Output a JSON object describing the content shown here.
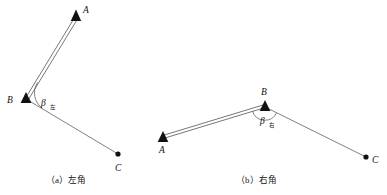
{
  "figure": {
    "background_color": "#ffffff",
    "line_color": "#4a4a4a",
    "marker_color": "#111111",
    "panels": [
      {
        "id": "panel-a",
        "caption_prefix": "（a）",
        "caption_text": "左角",
        "caption_full": "（a）左角",
        "points": [
          {
            "name": "A",
            "label": "A",
            "marker": "triangle",
            "x": 76,
            "y": 15,
            "label_x": 82,
            "label_y": 11
          },
          {
            "name": "B",
            "label": "B",
            "marker": "triangle",
            "x": 26,
            "y": 98,
            "label_x": 9,
            "label_y": 102
          },
          {
            "name": "C",
            "label": "C",
            "marker": "dot",
            "x": 118,
            "y": 154,
            "label_x": 115,
            "label_y": 170
          }
        ],
        "segments": [
          {
            "from": "B",
            "to": "A",
            "style": "double"
          },
          {
            "from": "B",
            "to": "C",
            "style": "single"
          }
        ],
        "angle": {
          "vertex": "B",
          "symbol": "β",
          "subscript": "左",
          "label_x": 41,
          "label_y": 105,
          "arc_radius": 19,
          "sweep": "interior-clockwise-from-A-to-C"
        }
      },
      {
        "id": "panel-b",
        "caption_prefix": "（b）",
        "caption_text": "右角",
        "caption_full": "（b）右角",
        "points": [
          {
            "name": "A",
            "label": "A",
            "marker": "triangle",
            "x": 163,
            "y": 137,
            "label_x": 159,
            "label_y": 152
          },
          {
            "name": "B",
            "label": "B",
            "marker": "triangle",
            "x": 265,
            "y": 106,
            "label_x": 261,
            "label_y": 93
          },
          {
            "name": "C",
            "label": "C",
            "marker": "dot",
            "x": 366,
            "y": 157,
            "label_x": 372,
            "label_y": 170
          }
        ],
        "segments": [
          {
            "from": "B",
            "to": "A",
            "style": "double"
          },
          {
            "from": "B",
            "to": "C",
            "style": "single"
          }
        ],
        "angle": {
          "vertex": "B",
          "symbol": "β",
          "subscript": "右",
          "label_x": 261,
          "label_y": 123,
          "arc_radius": 13,
          "sweep": "exterior-below-from-A-to-C"
        }
      }
    ]
  }
}
